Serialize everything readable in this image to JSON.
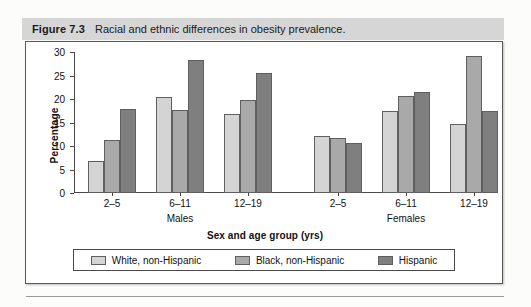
{
  "figure": {
    "number": "Figure 7.3",
    "caption": "Racial and ethnic differences in obesity prevalence."
  },
  "chart_data": {
    "type": "bar",
    "title": "Racial and ethnic differences in obesity prevalence.",
    "xlabel": "Sex and age group (yrs)",
    "ylabel": "Percentage",
    "ylim": [
      0,
      30
    ],
    "yticks": [
      0,
      5,
      10,
      15,
      20,
      25,
      30
    ],
    "grid": false,
    "legend_position": "bottom",
    "groups": [
      "Males",
      "Females"
    ],
    "categories": [
      "2–5",
      "6–11",
      "12–19",
      "2–5",
      "6–11",
      "12–19"
    ],
    "category_group": [
      "Males",
      "Males",
      "Males",
      "Females",
      "Females",
      "Females"
    ],
    "series": [
      {
        "name": "White, non-Hispanic",
        "color": "#d4d4d4",
        "values": [
          6.8,
          20.5,
          16.8,
          12.1,
          17.4,
          14.7
        ]
      },
      {
        "name": "Black, non-Hispanic",
        "color": "#a9a9a9",
        "values": [
          11.3,
          17.7,
          19.8,
          11.8,
          20.7,
          29.2
        ]
      },
      {
        "name": "Hispanic",
        "color": "#7f7f7f",
        "values": [
          17.9,
          28.2,
          25.6,
          10.7,
          21.5,
          17.5
        ]
      }
    ]
  }
}
